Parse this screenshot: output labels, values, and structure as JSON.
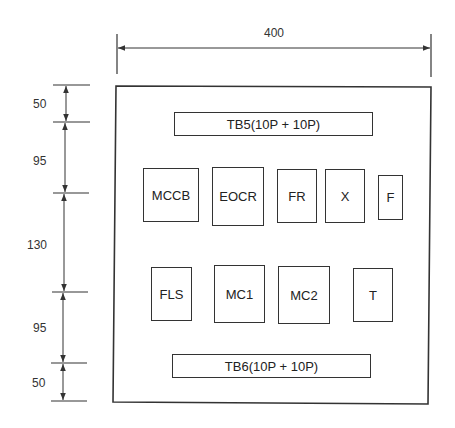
{
  "diagram": {
    "type": "panel-layout",
    "panel": {
      "width_label": "400"
    },
    "vertical_dimensions": [
      "50",
      "95",
      "130",
      "95",
      "50"
    ],
    "terminal_blocks": {
      "top": "TB5(10P + 10P)",
      "bottom": "TB6(10P + 10P)"
    },
    "row1": [
      {
        "label": "MCCB"
      },
      {
        "label": "EOCR"
      },
      {
        "label": "FR"
      },
      {
        "label": "X"
      },
      {
        "label": "F"
      }
    ],
    "row2": [
      {
        "label": "FLS"
      },
      {
        "label": "MC1"
      },
      {
        "label": "MC2"
      },
      {
        "label": "T"
      }
    ]
  }
}
